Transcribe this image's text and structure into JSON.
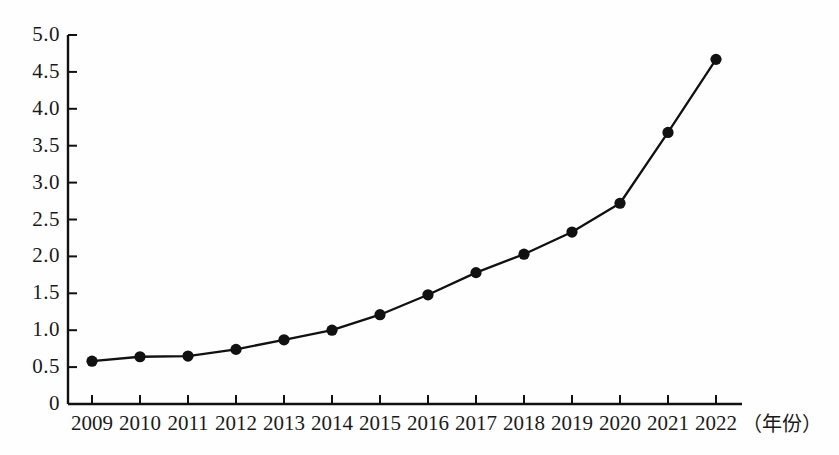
{
  "chart_data": {
    "type": "line",
    "title": "",
    "subtitle": "",
    "xlabel": "（年份）",
    "ylabel": "",
    "categories": [
      "2009",
      "2010",
      "2011",
      "2012",
      "2013",
      "2014",
      "2015",
      "2016",
      "2017",
      "2018",
      "2019",
      "2020",
      "2021",
      "2022"
    ],
    "values": [
      0.58,
      0.64,
      0.65,
      0.74,
      0.87,
      1.0,
      1.21,
      1.48,
      1.78,
      2.03,
      2.33,
      2.72,
      3.68,
      4.67
    ],
    "series": [
      {
        "name": "",
        "values": [
          0.58,
          0.64,
          0.65,
          0.74,
          0.87,
          1.0,
          1.21,
          1.48,
          1.78,
          2.03,
          2.33,
          2.72,
          3.68,
          4.67
        ]
      }
    ],
    "ylim": [
      0,
      5.0
    ],
    "ytick_labels": [
      "0",
      "0.5",
      "1.0",
      "1.5",
      "2.0",
      "2.5",
      "3.0",
      "3.5",
      "4.0",
      "4.5",
      "5.0"
    ],
    "ytick_values": [
      0,
      0.5,
      1.0,
      1.5,
      2.0,
      2.5,
      3.0,
      3.5,
      4.0,
      4.5,
      5.0
    ],
    "xtick_labels": [
      "2009",
      "2010",
      "2011",
      "2012",
      "2013",
      "2014",
      "2015",
      "2016",
      "2017",
      "2018",
      "2019",
      "2020",
      "2021",
      "2022"
    ],
    "grid": false,
    "legend": "none",
    "marker": "filled-circle",
    "colors": {
      "line": "#111111",
      "marker": "#111111",
      "axis": "#111111",
      "background": "#fefefe",
      "text": "#1a1a1a"
    }
  },
  "axes": {
    "y_axis_name": "value-axis",
    "x_axis_name": "year-axis",
    "x_unit_label": "（年份）"
  }
}
